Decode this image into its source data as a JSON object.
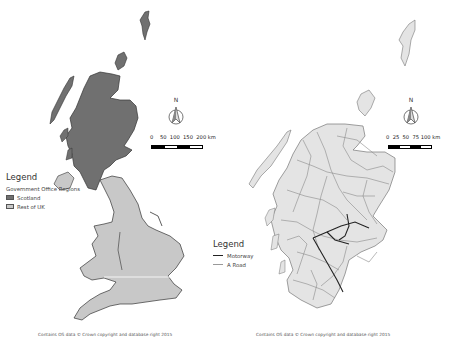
{
  "colors": {
    "scotland_fill": "#707070",
    "rest_uk_fill": "#c8c8c8",
    "coast_outline": "#333333",
    "motorway": "#222222",
    "a_road": "#8a8a8a",
    "scotland_land_right": "#e4e4e4"
  },
  "left_map": {
    "legend": {
      "title": "Legend",
      "subtitle": "Government Office Regions",
      "items": [
        {
          "label": "Scotland",
          "color": "#707070"
        },
        {
          "label": "Rest of UK",
          "color": "#c8c8c8"
        }
      ]
    },
    "north_arrow": {
      "label": "N",
      "icon": "north-arrow-icon"
    },
    "scale_bar": {
      "labels": [
        "0",
        "50",
        "100",
        "150",
        "200 km"
      ],
      "unit": "km"
    },
    "credit": "Contains OS data © Crown copyright and database right 2015"
  },
  "right_map": {
    "legend": {
      "title": "Legend",
      "items": [
        {
          "label": "Motorway",
          "style": "dark-line"
        },
        {
          "label": "A Road",
          "style": "light-line"
        }
      ]
    },
    "north_arrow": {
      "label": "N",
      "icon": "north-arrow-icon"
    },
    "scale_bar": {
      "labels": [
        "0",
        "25",
        "50",
        "75",
        "100 km"
      ],
      "unit": "km"
    },
    "credit": "Contains OS data © Crown copyright and database right 2015"
  }
}
